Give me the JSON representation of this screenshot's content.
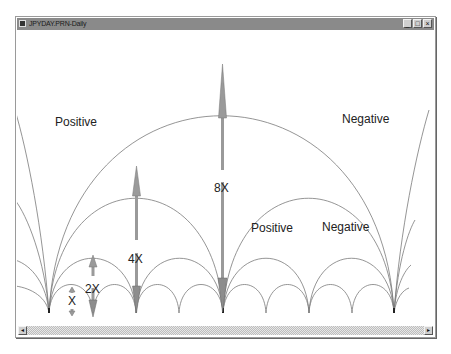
{
  "window": {
    "title": "JPYDAY.PRN-Daily",
    "icon": "app-chart-icon",
    "buttons": {
      "minimize": "_",
      "maximize": "□",
      "close": "×"
    }
  },
  "scrollbar": {
    "left_arrow": "◂",
    "right_arrow": "▸"
  },
  "labels": {
    "positive_large": "Positive",
    "negative_large": "Negative",
    "positive_medium": "Positive",
    "negative_medium": "Negative",
    "x8": "8X",
    "x4": "4X",
    "x2": "2X",
    "x1": "X"
  },
  "colors": {
    "arc": "#7a7a7a",
    "arrow": "#9a9a9a",
    "arrow_dark": "#6f6f6f",
    "titlebar": "#8a8a8a"
  }
}
